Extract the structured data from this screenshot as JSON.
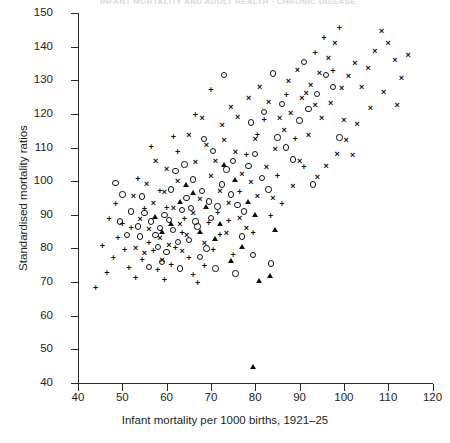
{
  "figure": {
    "cropped_title_fragment": "INFANT MORTALITY AND ADULT HEALTH · CHRONIC DISEASE"
  },
  "chart_data": {
    "type": "scatter",
    "title": "",
    "xlabel": "Infant mortality per 1000 births, 1921–25",
    "ylabel": "Standardised mortality ratios",
    "xlim": [
      40,
      120
    ],
    "ylim": [
      40,
      150
    ],
    "xticks": [
      40,
      50,
      60,
      70,
      80,
      90,
      100,
      110,
      120
    ],
    "yticks": [
      40,
      50,
      60,
      70,
      80,
      90,
      100,
      110,
      120,
      130,
      140,
      150
    ],
    "grid": false,
    "legend": "none",
    "marker_types": [
      "circle",
      "cross",
      "plus",
      "triangle"
    ],
    "series": [
      {
        "name": "circle",
        "marker": "circle",
        "points": [
          [
            48.5,
            99.5
          ],
          [
            50.0,
            96.0
          ],
          [
            52.0,
            91.0
          ],
          [
            49.5,
            88.0
          ],
          [
            53.5,
            86.5
          ],
          [
            55.0,
            90.5
          ],
          [
            56.5,
            88.0
          ],
          [
            54.0,
            83.5
          ],
          [
            57.5,
            84.0
          ],
          [
            58.5,
            86.0
          ],
          [
            59.5,
            90.0
          ],
          [
            60.5,
            88.5
          ],
          [
            61.5,
            85.5
          ],
          [
            58.0,
            80.5
          ],
          [
            60.0,
            79.0
          ],
          [
            62.5,
            82.0
          ],
          [
            63.5,
            91.5
          ],
          [
            64.5,
            95.0
          ],
          [
            65.5,
            92.0
          ],
          [
            66.5,
            88.0
          ],
          [
            62.0,
            103.0
          ],
          [
            64.0,
            105.0
          ],
          [
            66.0,
            100.5
          ],
          [
            68.0,
            97.0
          ],
          [
            69.5,
            94.0
          ],
          [
            67.0,
            86.5
          ],
          [
            70.0,
            89.0
          ],
          [
            71.5,
            92.5
          ],
          [
            72.5,
            99.0
          ],
          [
            73.5,
            103.5
          ],
          [
            70.5,
            109.0
          ],
          [
            68.5,
            112.5
          ],
          [
            74.5,
            96.0
          ],
          [
            76.0,
            93.0
          ],
          [
            77.5,
            91.0
          ],
          [
            75.0,
            106.0
          ],
          [
            78.5,
            104.5
          ],
          [
            80.0,
            108.0
          ],
          [
            81.5,
            101.0
          ],
          [
            83.0,
            97.5
          ],
          [
            79.0,
            117.5
          ],
          [
            82.0,
            120.5
          ],
          [
            85.0,
            113.0
          ],
          [
            87.0,
            110.0
          ],
          [
            88.5,
            106.5
          ],
          [
            86.0,
            123.0
          ],
          [
            90.0,
            118.0
          ],
          [
            92.0,
            121.5
          ],
          [
            94.0,
            126.0
          ],
          [
            96.0,
            131.5
          ],
          [
            97.5,
            128.0
          ],
          [
            91.0,
            135.5
          ],
          [
            84.0,
            132.0
          ],
          [
            73.0,
            131.5
          ],
          [
            59.0,
            76.0
          ],
          [
            56.0,
            74.5
          ],
          [
            63.0,
            74.0
          ],
          [
            67.5,
            77.5
          ],
          [
            71.0,
            74.0
          ],
          [
            75.5,
            72.5
          ],
          [
            79.5,
            78.0
          ],
          [
            83.5,
            75.5
          ],
          [
            93.0,
            99.0
          ],
          [
            99.0,
            113.0
          ],
          [
            54.5,
            95.5
          ],
          [
            51.0,
            84.0
          ],
          [
            61.0,
            97.5
          ],
          [
            65.0,
            82.5
          ],
          [
            69.0,
            80.0
          ],
          [
            77.0,
            83.5
          ]
        ]
      },
      {
        "name": "cross",
        "marker": "cross",
        "points": [
          [
            52.5,
            95.5
          ],
          [
            55.5,
            99.0
          ],
          [
            57.0,
            93.5
          ],
          [
            59.5,
            96.5
          ],
          [
            61.5,
            92.0
          ],
          [
            54.0,
            88.5
          ],
          [
            56.0,
            85.5
          ],
          [
            58.5,
            83.0
          ],
          [
            60.5,
            81.0
          ],
          [
            63.0,
            87.0
          ],
          [
            64.5,
            84.0
          ],
          [
            66.0,
            90.5
          ],
          [
            67.5,
            94.5
          ],
          [
            65.0,
            113.5
          ],
          [
            69.0,
            110.5
          ],
          [
            71.0,
            106.0
          ],
          [
            73.0,
            112.0
          ],
          [
            75.5,
            108.5
          ],
          [
            77.0,
            102.0
          ],
          [
            79.0,
            99.5
          ],
          [
            70.0,
            101.5
          ],
          [
            72.0,
            97.0
          ],
          [
            74.0,
            93.5
          ],
          [
            76.5,
            89.0
          ],
          [
            78.0,
            86.0
          ],
          [
            80.5,
            95.5
          ],
          [
            82.5,
            104.0
          ],
          [
            84.5,
            109.5
          ],
          [
            86.5,
            115.0
          ],
          [
            88.0,
            120.0
          ],
          [
            90.5,
            124.5
          ],
          [
            92.5,
            128.5
          ],
          [
            94.5,
            132.0
          ],
          [
            96.5,
            136.5
          ],
          [
            98.0,
            141.0
          ],
          [
            87.5,
            129.5
          ],
          [
            89.5,
            133.0
          ],
          [
            91.5,
            126.0
          ],
          [
            93.5,
            122.5
          ],
          [
            95.0,
            118.5
          ],
          [
            97.0,
            123.0
          ],
          [
            99.5,
            127.5
          ],
          [
            101.0,
            131.0
          ],
          [
            102.5,
            135.0
          ],
          [
            104.0,
            128.0
          ],
          [
            105.5,
            133.5
          ],
          [
            107.0,
            138.5
          ],
          [
            108.5,
            144.5
          ],
          [
            110.0,
            141.0
          ],
          [
            111.5,
            136.0
          ],
          [
            113.0,
            130.5
          ],
          [
            114.5,
            137.5
          ],
          [
            106.0,
            121.5
          ],
          [
            103.0,
            117.0
          ],
          [
            100.5,
            112.0
          ],
          [
            98.5,
            108.0
          ],
          [
            96.0,
            104.5
          ],
          [
            94.0,
            101.0
          ],
          [
            92.0,
            113.5
          ],
          [
            85.5,
            118.5
          ],
          [
            83.0,
            123.5
          ],
          [
            81.0,
            128.0
          ],
          [
            78.5,
            124.5
          ],
          [
            76.0,
            119.0
          ],
          [
            74.5,
            122.0
          ],
          [
            72.5,
            116.5
          ],
          [
            68.0,
            118.5
          ],
          [
            66.5,
            105.5
          ],
          [
            62.5,
            100.0
          ],
          [
            60.0,
            103.5
          ],
          [
            57.5,
            106.0
          ],
          [
            53.0,
            80.0
          ],
          [
            55.0,
            78.5
          ],
          [
            59.0,
            76.5
          ],
          [
            63.5,
            79.0
          ],
          [
            68.5,
            81.5
          ],
          [
            73.5,
            84.5
          ],
          [
            80.0,
            112.5
          ],
          [
            84.0,
            95.0
          ],
          [
            88.5,
            98.5
          ],
          [
            90.0,
            106.0
          ],
          [
            100.0,
            118.0
          ],
          [
            109.0,
            126.5
          ],
          [
            112.0,
            122.5
          ],
          [
            102.0,
            107.5
          ]
        ]
      },
      {
        "name": "plus",
        "marker": "plus",
        "points": [
          [
            44.0,
            68.0
          ],
          [
            46.5,
            72.5
          ],
          [
            48.0,
            77.0
          ],
          [
            45.5,
            80.5
          ],
          [
            49.0,
            83.0
          ],
          [
            50.5,
            79.5
          ],
          [
            51.5,
            74.0
          ],
          [
            53.0,
            71.0
          ],
          [
            54.5,
            76.5
          ],
          [
            56.0,
            81.5
          ],
          [
            52.0,
            86.0
          ],
          [
            57.0,
            79.0
          ],
          [
            58.0,
            73.5
          ],
          [
            59.5,
            70.5
          ],
          [
            61.0,
            75.0
          ],
          [
            62.0,
            80.0
          ],
          [
            63.5,
            84.5
          ],
          [
            65.0,
            77.0
          ],
          [
            66.0,
            72.0
          ],
          [
            67.0,
            69.5
          ],
          [
            68.5,
            74.5
          ],
          [
            70.5,
            79.5
          ],
          [
            72.0,
            84.0
          ],
          [
            64.0,
            88.5
          ],
          [
            60.0,
            92.0
          ],
          [
            55.0,
            91.5
          ],
          [
            50.0,
            87.0
          ],
          [
            47.0,
            88.5
          ],
          [
            58.5,
            97.0
          ],
          [
            62.5,
            108.5
          ],
          [
            56.5,
            110.0
          ],
          [
            66.5,
            119.5
          ],
          [
            69.5,
            87.5
          ],
          [
            71.5,
            90.5
          ],
          [
            74.0,
            88.0
          ],
          [
            76.5,
            96.5
          ],
          [
            78.0,
            107.5
          ],
          [
            80.5,
            113.5
          ],
          [
            82.0,
            118.0
          ],
          [
            85.0,
            101.5
          ],
          [
            87.0,
            125.5
          ],
          [
            89.0,
            112.5
          ],
          [
            91.0,
            104.0
          ],
          [
            93.5,
            138.0
          ],
          [
            95.5,
            142.5
          ],
          [
            97.5,
            132.5
          ],
          [
            75.0,
            78.0
          ],
          [
            79.5,
            84.5
          ],
          [
            83.5,
            89.5
          ],
          [
            86.0,
            93.0
          ],
          [
            48.5,
            93.0
          ],
          [
            53.5,
            100.5
          ],
          [
            61.5,
            113.0
          ],
          [
            70.0,
            127.0
          ],
          [
            99.0,
            145.5
          ]
        ]
      },
      {
        "name": "triangle",
        "marker": "triangle",
        "points": [
          [
            79.5,
            45.0
          ],
          [
            81.0,
            70.5
          ],
          [
            83.5,
            72.0
          ],
          [
            74.5,
            76.5
          ],
          [
            77.0,
            80.5
          ],
          [
            72.0,
            87.5
          ],
          [
            69.0,
            92.5
          ],
          [
            66.0,
            96.5
          ],
          [
            75.5,
            100.5
          ],
          [
            78.5,
            94.0
          ],
          [
            71.0,
            83.0
          ],
          [
            67.5,
            85.0
          ],
          [
            63.0,
            94.0
          ],
          [
            59.0,
            85.0
          ],
          [
            84.5,
            85.5
          ],
          [
            80.0,
            90.0
          ],
          [
            73.0,
            105.0
          ],
          [
            64.5,
            99.0
          ],
          [
            61.0,
            87.5
          ],
          [
            57.5,
            89.5
          ]
        ]
      }
    ]
  }
}
